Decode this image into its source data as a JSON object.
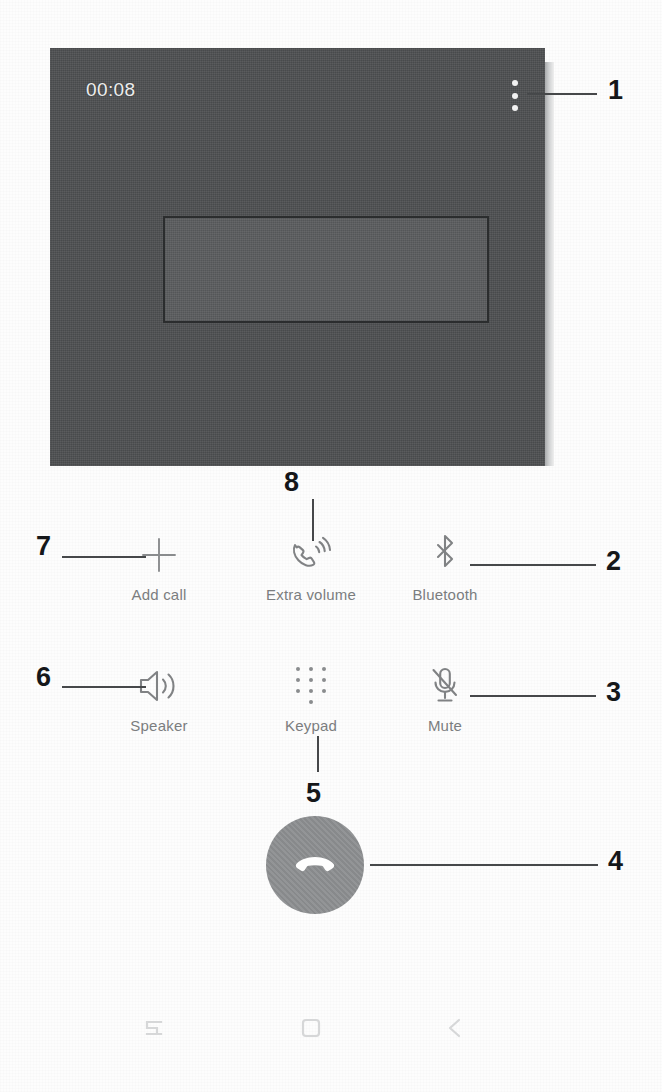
{
  "screen": {
    "type": "android-in-call-screen",
    "call_timer": "00:08",
    "overflow_menu_icon": "more-vertical-icon",
    "redacted_contact_area": ""
  },
  "controls": [
    {
      "key": "add_call",
      "label": "Add call",
      "icon": "plus-icon"
    },
    {
      "key": "extra_volume",
      "label": "Extra volume",
      "icon": "handset-volume-icon"
    },
    {
      "key": "bluetooth",
      "label": "Bluetooth",
      "icon": "bluetooth-icon"
    },
    {
      "key": "speaker",
      "label": "Speaker",
      "icon": "speaker-icon"
    },
    {
      "key": "keypad",
      "label": "Keypad",
      "icon": "keypad-dots-icon"
    },
    {
      "key": "mute",
      "label": "Mute",
      "icon": "microphone-muted-icon"
    }
  ],
  "end_call": {
    "icon": "end-call-handset-icon",
    "button_color": "#8d8f91"
  },
  "navbar": [
    {
      "key": "recents",
      "icon": "recents-icon"
    },
    {
      "key": "home",
      "icon": "home-square-icon"
    },
    {
      "key": "back",
      "icon": "back-chevron-icon"
    }
  ],
  "callouts": [
    {
      "number": "1",
      "target": "overflow-menu"
    },
    {
      "number": "2",
      "target": "bluetooth"
    },
    {
      "number": "3",
      "target": "mute"
    },
    {
      "number": "4",
      "target": "end-call"
    },
    {
      "number": "5",
      "target": "keypad"
    },
    {
      "number": "6",
      "target": "speaker"
    },
    {
      "number": "7",
      "target": "add-call"
    },
    {
      "number": "8",
      "target": "extra-volume"
    }
  ],
  "colors": {
    "panel": "#4f5153",
    "timer_text": "#eceded",
    "label_text": "#7b7d7f",
    "callout_text": "#15171a",
    "leader_line": "#46484a"
  }
}
